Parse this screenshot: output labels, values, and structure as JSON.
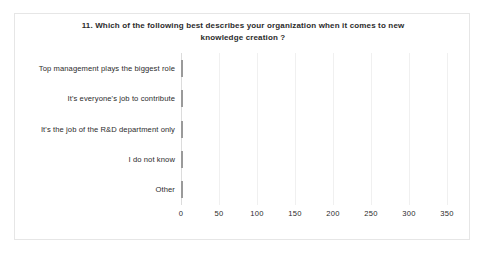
{
  "chart_data": {
    "type": "bar",
    "orientation": "horizontal",
    "title": "11. Which of the following  best describes  your organization  when it comes  to new knowledge  creation  ?",
    "title_lines": [
      "11. Which of the following  best describes  your organization  when it comes  to new",
      "knowledge  creation  ?"
    ],
    "categories": [
      "Top management  plays the biggest role",
      "It's everyone's job to contribute",
      "It's the job of the R&D department only",
      "I do not know",
      "Other"
    ],
    "values": [
      300,
      128,
      90,
      89,
      42
    ],
    "xlabel": "",
    "ylabel": "",
    "xlim": [
      0,
      350
    ],
    "xticks": [
      "0",
      "50",
      "100",
      "150",
      "200",
      "250",
      "300",
      "350"
    ],
    "xtick_values": [
      0,
      50,
      100,
      150,
      200,
      250,
      300,
      350
    ],
    "grid": "vertical",
    "legend": "none",
    "colors": {
      "bar_fill_light": "#f3f3f3",
      "bar_fill_dark": "#cfcfcf",
      "bar_border": "#9a9a9a",
      "gridline": "#f0f0f0",
      "axis": "#dcdcdc",
      "text": "#2b2b2b",
      "frame_border": "#e6e6e6",
      "background": "#ffffff"
    }
  }
}
